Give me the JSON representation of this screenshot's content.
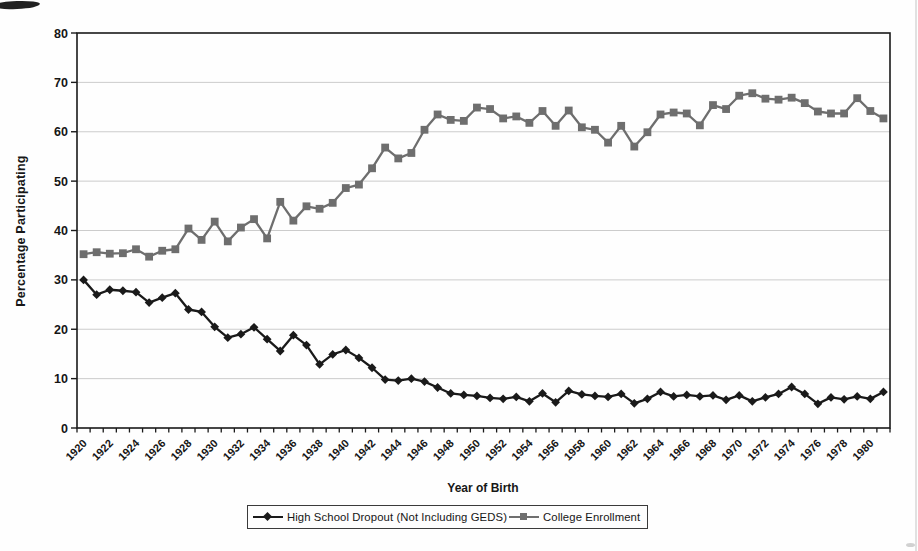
{
  "chart_data": {
    "type": "line",
    "title": "",
    "xlabel": "Year of Birth",
    "ylabel": "Percentage Participating",
    "ylim": [
      0,
      80
    ],
    "y_tick_step": 10,
    "y_tick_labels": [
      "0",
      "10",
      "20",
      "30",
      "40",
      "50",
      "60",
      "70",
      "80"
    ],
    "x_tick_labels": [
      "1920",
      "1922",
      "1924",
      "1926",
      "1928",
      "1930",
      "1932",
      "1934",
      "1936",
      "1938",
      "1940",
      "1942",
      "1944",
      "1946",
      "1948",
      "1950",
      "1952",
      "1954",
      "1956",
      "1958",
      "1960",
      "1962",
      "1964",
      "1966",
      "1968",
      "1970",
      "1972",
      "1974",
      "1976",
      "1978",
      "1980"
    ],
    "grid": true,
    "grid_color": "#c6c6c6",
    "axis_color": "#1a1a1a",
    "legend_position": "bottom-center",
    "x": [
      1920,
      1921,
      1922,
      1923,
      1924,
      1925,
      1926,
      1927,
      1928,
      1929,
      1930,
      1931,
      1932,
      1933,
      1934,
      1935,
      1936,
      1937,
      1938,
      1939,
      1940,
      1941,
      1942,
      1943,
      1944,
      1945,
      1946,
      1947,
      1948,
      1949,
      1950,
      1951,
      1952,
      1953,
      1954,
      1955,
      1956,
      1957,
      1958,
      1959,
      1960,
      1961,
      1962,
      1963,
      1964,
      1965,
      1966,
      1967,
      1968,
      1969,
      1970,
      1971,
      1972,
      1973,
      1974,
      1975,
      1976,
      1977,
      1978,
      1979,
      1980,
      1981
    ],
    "series": [
      {
        "name": "High School Dropout (Not Including GEDS)",
        "marker": "diamond",
        "color": "#1a1a1a",
        "values": [
          30,
          27,
          28,
          27.8,
          27.5,
          25.4,
          26.4,
          27.3,
          24,
          23.5,
          20.5,
          18.3,
          19,
          20.4,
          18,
          15.6,
          18.8,
          16.8,
          12.9,
          14.9,
          15.8,
          14.2,
          12.2,
          9.8,
          9.6,
          10,
          9.4,
          8.2,
          7,
          6.7,
          6.5,
          6.1,
          5.9,
          6.3,
          5.4,
          7,
          5.2,
          7.5,
          6.8,
          6.5,
          6.3,
          6.9,
          5,
          5.9,
          7.3,
          6.4,
          6.7,
          6.4,
          6.6,
          5.7,
          6.6,
          5.4,
          6.2,
          6.9,
          8.3,
          6.9,
          4.9,
          6.2,
          5.8,
          6.4,
          5.9,
          7.3
        ]
      },
      {
        "name": "College Enrollment",
        "marker": "square",
        "color": "#6e6e6e",
        "values": [
          35.2,
          35.6,
          35.3,
          35.4,
          36.2,
          34.7,
          35.9,
          36.2,
          40.4,
          38.1,
          41.8,
          37.8,
          40.6,
          42.3,
          38.4,
          45.8,
          42,
          44.9,
          44.4,
          45.6,
          48.6,
          49.3,
          52.6,
          56.8,
          54.6,
          55.7,
          60.4,
          63.5,
          62.4,
          62.2,
          64.9,
          64.6,
          62.7,
          63.1,
          61.8,
          64.2,
          61.2,
          64.3,
          60.9,
          60.4,
          57.8,
          61.2,
          57,
          59.9,
          63.5,
          63.9,
          63.7,
          61.3,
          65.4,
          64.6,
          67.3,
          67.8,
          66.7,
          66.5,
          66.9,
          65.8,
          64.1,
          63.7,
          63.7,
          66.8,
          64.2,
          62.7
        ]
      }
    ]
  }
}
